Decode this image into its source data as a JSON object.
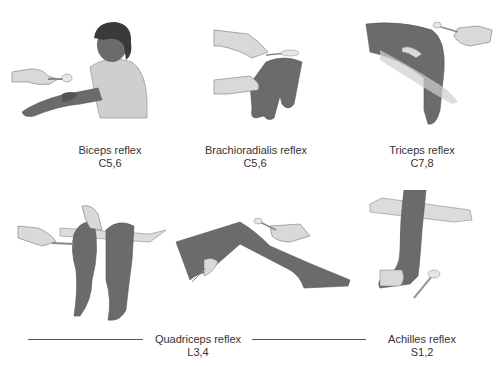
{
  "figure": {
    "colors": {
      "skin_dark": "#6b6b6b",
      "skin_light": "#d9d9d9",
      "shirt": "#cfcfcf",
      "hair": "#3a3a3a",
      "line": "#555555",
      "text": "#333333"
    },
    "panels": [
      {
        "id": "biceps",
        "name": "Biceps reflex",
        "roots": "C5,6"
      },
      {
        "id": "brachioradialis",
        "name": "Brachioradialis reflex",
        "roots": "C5,6"
      },
      {
        "id": "triceps",
        "name": "Triceps reflex",
        "roots": "C7,8"
      },
      {
        "id": "quadriceps",
        "name": "Quadriceps reflex",
        "roots": "L3,4"
      },
      {
        "id": "achilles",
        "name": "Achilles reflex",
        "roots": "S1,2"
      }
    ]
  }
}
